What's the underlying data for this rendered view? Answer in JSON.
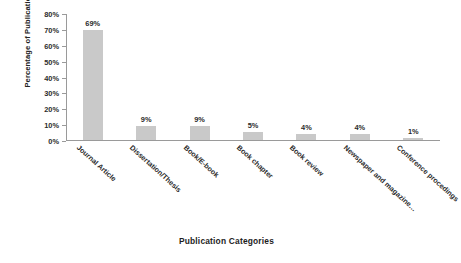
{
  "chart_data": {
    "type": "bar",
    "title": "",
    "xlabel": "Publication Categories",
    "ylabel": "Percentage of Publication Categories",
    "categories": [
      "Journal Article",
      "Dissertation/Thesis",
      "Book/E-book",
      "Book chapter",
      "Book review",
      "Newspaper and magazine…",
      "Conference procedings"
    ],
    "values": [
      69,
      9,
      9,
      5,
      4,
      4,
      1
    ],
    "value_labels": [
      "69%",
      "9%",
      "9%",
      "5%",
      "4%",
      "4%",
      "1%"
    ],
    "ylim": [
      0,
      80
    ],
    "ytick_values": [
      0,
      10,
      20,
      30,
      40,
      50,
      60,
      70,
      80
    ],
    "ytick_labels": [
      "0%",
      "10%",
      "20%",
      "30%",
      "40%",
      "50%",
      "60%",
      "70%",
      "80%"
    ],
    "grid": false,
    "legend": false,
    "legend_position": "none",
    "bar_color": "#c9c9c9",
    "axis_color": "#9a9a9a",
    "text_color": "#2b2b2b",
    "background": "#ffffff"
  }
}
